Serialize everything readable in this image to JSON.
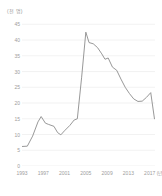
{
  "chart_data": {
    "type": "line",
    "title": "",
    "subtitle": "",
    "xlabel": "(년)",
    "ylabel": "(천 명)",
    "unit_label": "(천 명)",
    "x_unit_label": "(년)",
    "grid": true,
    "legend": "none",
    "line_color": "#8c8c8c",
    "grid_color": "#ececec",
    "tick_color": "#9d9d9d",
    "ylim": [
      0,
      47
    ],
    "yticks": [
      0,
      5,
      10,
      15,
      20,
      25,
      30,
      35,
      40,
      45
    ],
    "ytick_labels": [
      "0",
      "5",
      "10",
      "15",
      "20",
      "25",
      "30",
      "35",
      "40",
      "45"
    ],
    "xlim": [
      1993,
      2018
    ],
    "xticks": [
      1993,
      1997,
      2001,
      2005,
      2009,
      2013,
      2017
    ],
    "xtick_labels": [
      "1993",
      "1997",
      "2001",
      "2005",
      "2009",
      "2013",
      "2017"
    ],
    "x": [
      1993,
      1994,
      1995,
      1996,
      1997,
      1998,
      1999,
      2000,
      2001,
      2002,
      2003,
      2004,
      2005,
      2006,
      2007,
      2008,
      2009,
      2010,
      2011,
      2012,
      2013,
      2014,
      2015,
      2016,
      2017,
      2018
    ],
    "values": [
      6.2,
      6.3,
      9.5,
      14.0,
      15.7,
      13.2,
      12.6,
      11.0,
      9.9,
      12.4,
      14.6,
      15.0,
      28.5,
      42.5,
      39.0,
      38.8,
      37.2,
      35.0,
      33.9,
      34.3,
      30.6,
      27.2,
      24.4,
      21.9,
      20.4,
      20.6
    ],
    "values_tail": [
      23.3,
      15.0
    ],
    "series": [
      {
        "name": "series-1",
        "points": [
          {
            "x": 1993,
            "y": 6.2
          },
          {
            "x": 1994,
            "y": 6.3
          },
          {
            "x": 1995,
            "y": 9.5
          },
          {
            "x": 1996,
            "y": 14.0
          },
          {
            "x": 1996.6,
            "y": 15.7
          },
          {
            "x": 1997.4,
            "y": 13.6
          },
          {
            "x": 1998,
            "y": 13.2
          },
          {
            "x": 1999,
            "y": 12.6
          },
          {
            "x": 1999.7,
            "y": 10.6
          },
          {
            "x": 2000.3,
            "y": 9.9
          },
          {
            "x": 2001,
            "y": 11.2
          },
          {
            "x": 2002,
            "y": 12.9
          },
          {
            "x": 2002.8,
            "y": 14.6
          },
          {
            "x": 2003.4,
            "y": 15.0
          },
          {
            "x": 2004.2,
            "y": 28.0
          },
          {
            "x": 2005.0,
            "y": 42.5
          },
          {
            "x": 2005.6,
            "y": 39.2
          },
          {
            "x": 2006.4,
            "y": 38.8
          },
          {
            "x": 2007.2,
            "y": 37.6
          },
          {
            "x": 2008.0,
            "y": 35.6
          },
          {
            "x": 2008.6,
            "y": 33.9
          },
          {
            "x": 2009.2,
            "y": 34.3
          },
          {
            "x": 2010.0,
            "y": 31.4
          },
          {
            "x": 2010.8,
            "y": 30.4
          },
          {
            "x": 2011.6,
            "y": 27.6
          },
          {
            "x": 2012.4,
            "y": 25.0
          },
          {
            "x": 2013.2,
            "y": 23.0
          },
          {
            "x": 2014.0,
            "y": 21.3
          },
          {
            "x": 2014.8,
            "y": 20.5
          },
          {
            "x": 2015.6,
            "y": 20.6
          },
          {
            "x": 2016.4,
            "y": 21.8
          },
          {
            "x": 2017.2,
            "y": 23.3
          },
          {
            "x": 2017.9,
            "y": 15.0
          }
        ]
      }
    ]
  }
}
